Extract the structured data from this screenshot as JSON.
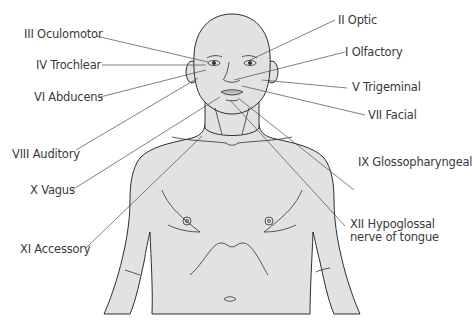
{
  "diagram": {
    "colors": {
      "skin": "#e2e2e2",
      "outline": "#2e2e2e",
      "leader_line": "#4a4a4a",
      "label_text": "#3a3a3a",
      "background": "#ffffff"
    },
    "labels_left": [
      {
        "id": "III",
        "text": "III Oculomotor"
      },
      {
        "id": "IV",
        "text": "IV Trochlear"
      },
      {
        "id": "VI",
        "text": "VI Abducens"
      },
      {
        "id": "VIII",
        "text": "VIII Auditory"
      },
      {
        "id": "X",
        "text": "X Vagus"
      },
      {
        "id": "XI",
        "text": "XI Accessory"
      }
    ],
    "labels_right": [
      {
        "id": "II",
        "text": "II Optic"
      },
      {
        "id": "I",
        "text": "I Olfactory"
      },
      {
        "id": "V",
        "text": "V Trigeminal"
      },
      {
        "id": "VII",
        "text": "VII Facial"
      },
      {
        "id": "IX",
        "text": "IX Glossopharyngeal"
      },
      {
        "id": "XII",
        "text": "XII Hypoglossal nerve of tongue"
      }
    ]
  }
}
